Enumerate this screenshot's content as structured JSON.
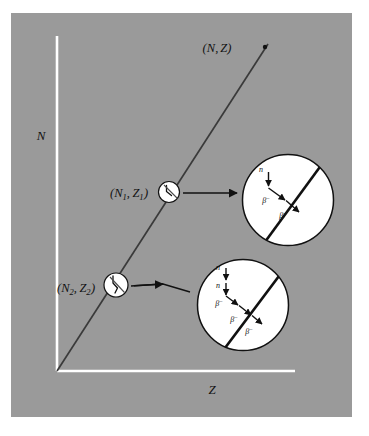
{
  "figure": {
    "name": "nuclide-chart-beta-decay-diagram",
    "panel_color": "#9a9a9a",
    "axis_color": "#ffffff",
    "line_color": "#3a3a3a",
    "inset_fill": "#ffffff",
    "ink_color": "#111111"
  },
  "axes": {
    "y_label": "N",
    "x_label": "Z"
  },
  "stability_line": {
    "endpoint_label": "(N, Z)",
    "endpoint_label_open": "(",
    "endpoint_label_n": "N",
    "endpoint_label_comma": ",",
    "endpoint_label_z": "Z",
    "endpoint_label_close": ")"
  },
  "nodes": [
    {
      "id": "node-1",
      "label_open": "(",
      "label_n": "N",
      "label_n_sub": "1",
      "label_comma": ",",
      "label_z": "Z",
      "label_z_sub": "1",
      "label_close": ")",
      "label_full": "(N1, Z1)"
    },
    {
      "id": "node-2",
      "label_open": "(",
      "label_n": "N",
      "label_n_sub": "2",
      "label_comma": ",",
      "label_z": "Z",
      "label_z_sub": "2",
      "label_close": ")",
      "label_full": "(N2, Z2)"
    }
  ],
  "insets": [
    {
      "id": "inset-1",
      "source_node": "node-1",
      "neutron_labels": [
        "n"
      ],
      "beta_labels": [
        {
          "symbol": "β",
          "sup": "−"
        },
        {
          "symbol": "β",
          "sup": "−"
        }
      ]
    },
    {
      "id": "inset-2",
      "source_node": "node-2",
      "neutron_labels": [
        "n",
        "n"
      ],
      "beta_labels": [
        {
          "symbol": "β",
          "sup": "−"
        },
        {
          "symbol": "β",
          "sup": "−"
        },
        {
          "symbol": "β",
          "sup": "−"
        }
      ]
    }
  ]
}
